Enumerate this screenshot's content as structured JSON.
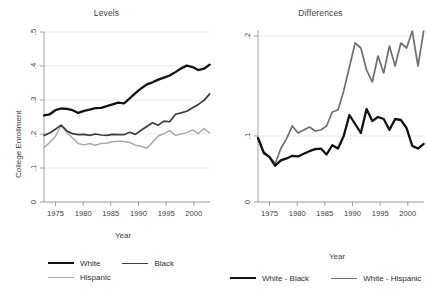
{
  "figure": {
    "width": 427,
    "height": 295,
    "background": "#ffffff"
  },
  "panels": {
    "left": {
      "title": "Levels",
      "ylabel": "College Enrollment",
      "xlabel": "Year"
    },
    "right": {
      "title": "Differences",
      "ylabel": "Difference",
      "xlabel": "Year"
    }
  },
  "legend": {
    "left": [
      {
        "label": "White",
        "color": "#111111",
        "width": 2.2
      },
      {
        "label": "Black",
        "color": "#3d3d3d",
        "width": 1.6
      },
      {
        "label": "Hispanic",
        "color": "#a9a9a9",
        "width": 1.4
      }
    ],
    "right": [
      {
        "label": "White - Black",
        "color": "#111111",
        "width": 2.2
      },
      {
        "label": "White - Hispanic",
        "color": "#6f6f6f",
        "width": 1.6
      }
    ]
  },
  "colors": {
    "white_series": "#111111",
    "black_series": "#3d3d3d",
    "hispanic_series": "#a9a9a9",
    "white_minus_black": "#111111",
    "white_minus_hispanic": "#6f6f6f",
    "axis": "#9a9a9a",
    "grid": "#e3e3e3",
    "text": "#3d3d3d"
  },
  "chart_data": [
    {
      "type": "line",
      "panel": "left",
      "title": "Levels",
      "xlabel": "Year",
      "ylabel": "College Enrollment",
      "xlim": [
        1973,
        2002
      ],
      "ylim": [
        0,
        0.5
      ],
      "xticks": [
        1975,
        1980,
        1985,
        1990,
        1995,
        2000
      ],
      "yticks": [
        0,
        0.1,
        0.2,
        0.3,
        0.4,
        0.5
      ],
      "ytick_labels": [
        "0",
        ".1",
        ".2",
        ".3",
        ".4",
        ".5"
      ],
      "grid": "horizontal",
      "legend_position": "below-figure-left",
      "x": [
        1973,
        1974,
        1975,
        1976,
        1977,
        1978,
        1979,
        1980,
        1981,
        1982,
        1983,
        1984,
        1985,
        1986,
        1987,
        1988,
        1989,
        1990,
        1991,
        1992,
        1993,
        1994,
        1995,
        1996,
        1997,
        1998,
        1999,
        2000,
        2001,
        2002
      ],
      "series": [
        {
          "name": "White",
          "color": "#111111",
          "values": [
            0.255,
            0.258,
            0.27,
            0.275,
            0.274,
            0.27,
            0.262,
            0.268,
            0.272,
            0.276,
            0.277,
            0.282,
            0.287,
            0.292,
            0.29,
            0.305,
            0.32,
            0.334,
            0.346,
            0.352,
            0.36,
            0.366,
            0.372,
            0.382,
            0.393,
            0.401,
            0.397,
            0.388,
            0.392,
            0.404
          ]
        },
        {
          "name": "Black",
          "color": "#3d3d3d",
          "values": [
            0.196,
            0.203,
            0.214,
            0.226,
            0.209,
            0.201,
            0.198,
            0.199,
            0.196,
            0.2,
            0.197,
            0.196,
            0.199,
            0.198,
            0.198,
            0.205,
            0.199,
            0.211,
            0.222,
            0.233,
            0.226,
            0.238,
            0.236,
            0.258,
            0.262,
            0.267,
            0.277,
            0.287,
            0.299,
            0.318
          ]
        },
        {
          "name": "Hispanic",
          "color": "#a9a9a9",
          "values": [
            0.16,
            0.175,
            0.193,
            0.225,
            0.205,
            0.188,
            0.172,
            0.168,
            0.172,
            0.167,
            0.172,
            0.173,
            0.177,
            0.179,
            0.178,
            0.175,
            0.167,
            0.164,
            0.158,
            0.176,
            0.194,
            0.201,
            0.21,
            0.196,
            0.2,
            0.204,
            0.212,
            0.201,
            0.216,
            0.203
          ]
        }
      ]
    },
    {
      "type": "line",
      "panel": "right",
      "title": "Differences",
      "xlabel": "Year",
      "ylabel": "Difference",
      "xlim": [
        1973,
        2002
      ],
      "ylim": [
        0,
        0.23
      ],
      "xticks": [
        1975,
        1980,
        1985,
        1990,
        1995,
        2000
      ],
      "yticks": [
        0,
        0.1,
        0.2
      ],
      "ytick_labels": [
        "0",
        ".1",
        ".2"
      ],
      "grid": "horizontal",
      "legend_position": "below-figure-right",
      "x": [
        1973,
        1974,
        1975,
        1976,
        1977,
        1978,
        1979,
        1980,
        1981,
        1982,
        1983,
        1984,
        1985,
        1986,
        1987,
        1988,
        1989,
        1990,
        1991,
        1992,
        1993,
        1994,
        1995,
        1996,
        1997,
        1998,
        1999,
        2000,
        2001,
        2002
      ],
      "series": [
        {
          "name": "White - Black",
          "color": "#111111",
          "values": [
            0.097,
            0.075,
            0.068,
            0.055,
            0.063,
            0.066,
            0.07,
            0.069,
            0.073,
            0.077,
            0.08,
            0.081,
            0.072,
            0.086,
            0.081,
            0.1,
            0.121,
            0.112,
            0.103,
            0.127,
            0.115,
            0.119,
            0.117,
            0.106,
            0.117,
            0.116,
            0.108,
            0.085,
            0.081,
            0.088
          ]
        },
        {
          "name": "White - Hispanic",
          "color": "#6f6f6f",
          "values": [
            0.097,
            0.073,
            0.069,
            0.058,
            0.081,
            0.096,
            0.11,
            0.103,
            0.106,
            0.109,
            0.105,
            0.106,
            0.11,
            0.124,
            0.126,
            0.145,
            0.169,
            0.193,
            0.188,
            0.166,
            0.154,
            0.18,
            0.163,
            0.19,
            0.17,
            0.193,
            0.188,
            0.205,
            0.17,
            0.205
          ]
        }
      ]
    }
  ]
}
